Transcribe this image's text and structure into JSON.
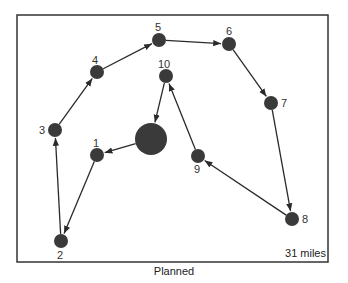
{
  "caption": "Planned",
  "distance_label": "31 miles",
  "colors": {
    "node": "#3a3a3a",
    "edge": "#2a2a2a",
    "frame": "#333333"
  },
  "depot": {
    "x": 151,
    "y": 139,
    "r": 16
  },
  "nodes": [
    {
      "id": "1",
      "x": 97,
      "y": 155,
      "lx": 93,
      "ly": 138
    },
    {
      "id": "2",
      "x": 61,
      "y": 241,
      "lx": 57,
      "ly": 250
    },
    {
      "id": "3",
      "x": 55,
      "y": 130,
      "lx": 39,
      "ly": 125
    },
    {
      "id": "4",
      "x": 97,
      "y": 72,
      "lx": 92,
      "ly": 55
    },
    {
      "id": "5",
      "x": 159,
      "y": 40,
      "lx": 155,
      "ly": 22
    },
    {
      "id": "6",
      "x": 229,
      "y": 44,
      "lx": 226,
      "ly": 26
    },
    {
      "id": "7",
      "x": 271,
      "y": 103,
      "lx": 281,
      "ly": 98
    },
    {
      "id": "8",
      "x": 292,
      "y": 219,
      "lx": 302,
      "ly": 214
    },
    {
      "id": "9",
      "x": 198,
      "y": 156,
      "lx": 194,
      "ly": 164
    },
    {
      "id": "10",
      "x": 166,
      "y": 76,
      "lx": 158,
      "ly": 59
    }
  ],
  "route": [
    "depot",
    "1",
    "2",
    "3",
    "4",
    "5",
    "6",
    "7",
    "8",
    "9",
    "10",
    "depot"
  ]
}
